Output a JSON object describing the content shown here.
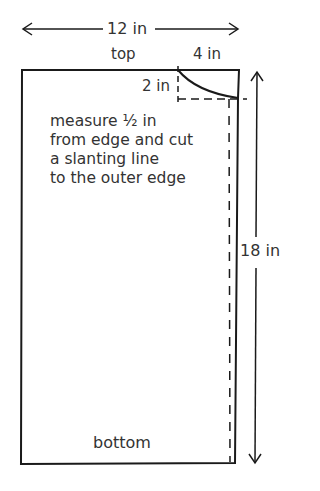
{
  "diagram": {
    "type": "sewing-pattern",
    "colors": {
      "line": "#1a1a1a",
      "text": "#333333",
      "background": "#ffffff"
    },
    "dimensions": {
      "width_label": "12 in",
      "height_label": "18 in",
      "corner_horizontal_label": "4 in",
      "corner_vertical_label": "2 in"
    },
    "edges": {
      "top_label": "top",
      "bottom_label": "bottom"
    },
    "instruction": {
      "lines": [
        "measure ½ in",
        "from edge and cut",
        "a slanting line",
        "to the outer edge"
      ]
    },
    "icons": {
      "width_arrow": "double-headed-horizontal-arrow",
      "height_arrow": "double-headed-vertical-arrow"
    }
  }
}
